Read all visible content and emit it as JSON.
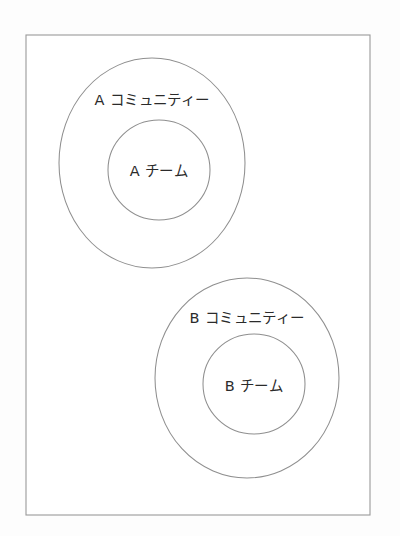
{
  "diagram": {
    "type": "venn-nested-circles",
    "title_visible": false,
    "background_color": "#fdfdfd",
    "frame": {
      "name": "outer-frame",
      "x": 26,
      "y": 35,
      "width": 344,
      "height": 480,
      "stroke_color": "#9a9a9a",
      "fill_color": "#ffffff"
    },
    "groups": [
      {
        "id": "a",
        "outer": {
          "label": "A コミュニティー",
          "cx": 152,
          "cy": 163,
          "rx": 93,
          "ry": 105,
          "label_x": 152,
          "label_y": 100,
          "stroke_color": "#8f8f8f"
        },
        "inner": {
          "label": "A チーム",
          "cx": 159,
          "cy": 170,
          "rx": 51,
          "ry": 50,
          "label_x": 159,
          "label_y": 171,
          "stroke_color": "#8f8f8f"
        }
      },
      {
        "id": "b",
        "outer": {
          "label": "B コミュニティー",
          "cx": 247,
          "cy": 378,
          "rx": 92,
          "ry": 100,
          "label_x": 247,
          "label_y": 318,
          "stroke_color": "#8f8f8f"
        },
        "inner": {
          "label": "B チーム",
          "cx": 254,
          "cy": 384,
          "rx": 51,
          "ry": 50,
          "label_x": 254,
          "label_y": 386,
          "stroke_color": "#8f8f8f"
        }
      }
    ]
  }
}
